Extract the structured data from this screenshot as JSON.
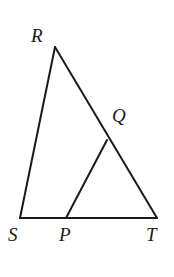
{
  "figure": {
    "kind": "geometry-diagram",
    "background_color": "#ffffff",
    "stroke_color": "#1a1a1a",
    "stroke_width": 2,
    "label_color": "#1a1a1a",
    "points": {
      "R": {
        "label": "R",
        "x": 55,
        "y": 47
      },
      "Q": {
        "label": "Q",
        "x": 107,
        "y": 140
      },
      "S": {
        "label": "S",
        "x": 20,
        "y": 218
      },
      "P": {
        "label": "P",
        "x": 66,
        "y": 218
      },
      "T": {
        "label": "T",
        "x": 157,
        "y": 218
      }
    },
    "segments": [
      {
        "name": "RS",
        "from": "R",
        "to": "S",
        "x1": 55,
        "y1": 47,
        "x2": 20,
        "y2": 218
      },
      {
        "name": "RT",
        "from": "R",
        "to": "T",
        "x1": 55,
        "y1": 47,
        "x2": 157,
        "y2": 218
      },
      {
        "name": "ST",
        "from": "S",
        "to": "T",
        "x1": 20,
        "y1": 218,
        "x2": 157,
        "y2": 218
      },
      {
        "name": "PQ",
        "from": "P",
        "to": "Q",
        "x1": 66,
        "y1": 218,
        "x2": 107,
        "y2": 140
      }
    ]
  }
}
